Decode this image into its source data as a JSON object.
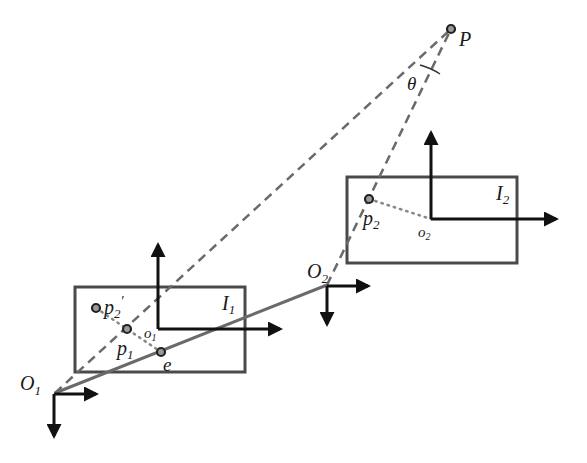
{
  "diagram": {
    "colors": {
      "frame": "#4a4a4a",
      "axes": "#111111",
      "ray_dashed": "#666666",
      "baseline": "#6a6a6a",
      "point_fill": "#9a9a9a"
    },
    "labels": {
      "P": "P",
      "theta": "θ",
      "O1_main": "O",
      "O1_sub": "1",
      "O2_main": "O",
      "O2_sub": "2",
      "I1_main": "I",
      "I1_sub": "1",
      "I2_main": "I",
      "I2_sub": "2",
      "p1_main": "p",
      "p1_sub": "1",
      "p2_main": "p",
      "p2_sub": "2",
      "p2prime_main": "p",
      "p2prime_sub": "2",
      "p2prime_mark": "′",
      "o1_main": "o",
      "o1_sub": "1",
      "o2_main": "o",
      "o2_sub": "2",
      "e": "e"
    },
    "nodes": [
      {
        "id": "P",
        "role": "3D point",
        "x": 451,
        "y": 29
      },
      {
        "id": "O1",
        "role": "camera center 1",
        "x": 55,
        "y": 393
      },
      {
        "id": "O2",
        "role": "camera center 2",
        "x": 327,
        "y": 285
      },
      {
        "id": "p1",
        "role": "projection in image 1",
        "x": 127,
        "y": 329
      },
      {
        "id": "p2",
        "role": "projection in image 2",
        "x": 369,
        "y": 199
      },
      {
        "id": "p2prime",
        "role": "reprojected p2 in image 1",
        "x": 96,
        "y": 308
      },
      {
        "id": "e",
        "role": "epipole",
        "x": 161,
        "y": 352
      },
      {
        "id": "o1",
        "role": "image 1 principal point",
        "x": 158,
        "y": 329
      },
      {
        "id": "o2",
        "role": "image 2 principal point",
        "x": 431,
        "y": 219
      }
    ],
    "planes": [
      {
        "id": "I1",
        "x": 75,
        "y": 287,
        "w": 170,
        "h": 85
      },
      {
        "id": "I2",
        "x": 347,
        "y": 177,
        "w": 170,
        "h": 86
      }
    ],
    "edges": [
      {
        "from": "O1",
        "to": "P",
        "style": "dashed"
      },
      {
        "from": "O2",
        "to": "P",
        "style": "dashed"
      },
      {
        "from": "O1",
        "to": "O2",
        "style": "solid",
        "note": "baseline through epipole e"
      },
      {
        "from": "p2",
        "to": "o2",
        "style": "dotted"
      },
      {
        "from": "p2prime",
        "to": "e",
        "style": "dotted",
        "note": "through p1 and o1"
      }
    ]
  }
}
